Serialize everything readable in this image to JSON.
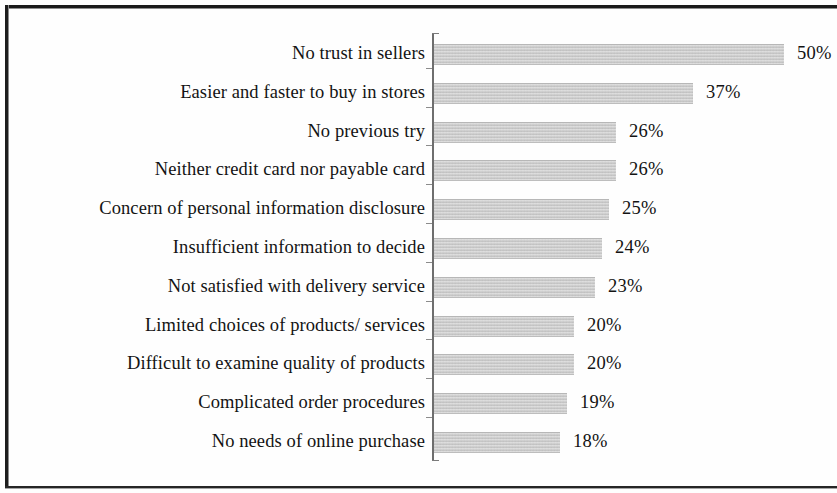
{
  "chart_data": {
    "type": "bar",
    "orientation": "horizontal",
    "title": "",
    "subtitle": "",
    "xlabel": "",
    "ylabel": "",
    "xlim": [
      0,
      50
    ],
    "grid": false,
    "legend": null,
    "value_suffix": "%",
    "bar_color": "#c6c6c6",
    "axis_color": "#6e6e6e",
    "text_color": "#131313",
    "categories": [
      "No trust in sellers",
      "Easier and faster to buy in stores",
      "No previous try",
      "Neither credit card nor payable card",
      "Concern of personal information disclosure",
      "Insufficient information to decide",
      "Not satisfied with delivery service",
      "Limited choices of products/ services",
      "Difficult to examine quality of products",
      "Complicated order procedures",
      "No needs of online purchase"
    ],
    "values": [
      50,
      37,
      26,
      26,
      25,
      24,
      23,
      20,
      20,
      19,
      18
    ],
    "data_labels": [
      "50%",
      "37%",
      "26%",
      "26%",
      "25%",
      "24%",
      "23%",
      "20%",
      "20%",
      "19%",
      "18%"
    ],
    "rows": [
      {
        "label": "No trust in sellers",
        "value": 50,
        "data_label": "50%"
      },
      {
        "label": "Easier and faster to buy in stores",
        "value": 37,
        "data_label": "37%"
      },
      {
        "label": "No previous try",
        "value": 26,
        "data_label": "26%"
      },
      {
        "label": "Neither credit card nor payable card",
        "value": 26,
        "data_label": "26%"
      },
      {
        "label": "Concern of personal information disclosure",
        "value": 25,
        "data_label": "25%"
      },
      {
        "label": "Insufficient information to decide",
        "value": 24,
        "data_label": "24%"
      },
      {
        "label": "Not satisfied with delivery service",
        "value": 23,
        "data_label": "23%"
      },
      {
        "label": "Limited choices of products/ services",
        "value": 20,
        "data_label": "20%"
      },
      {
        "label": "Difficult to examine quality of products",
        "value": 20,
        "data_label": "20%"
      },
      {
        "label": "Complicated order procedures",
        "value": 19,
        "data_label": "19%"
      },
      {
        "label": "No needs of online purchase",
        "value": 18,
        "data_label": "18%"
      }
    ]
  }
}
